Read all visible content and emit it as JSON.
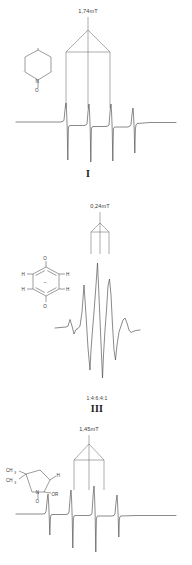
{
  "figure": {
    "type": "epr-spectra-figure",
    "panel_count": 3
  },
  "panels": [
    {
      "id": "panel-1",
      "roman_numeral": "I",
      "splitting_label": "1,74mT",
      "structure": {
        "name": "pyridine-N-oxide-ring",
        "atoms": [
          "N",
          "O"
        ],
        "ring": "six-membered"
      },
      "spectrum": {
        "name": "nitroxide-triplet",
        "line_count": 3,
        "pattern": "1:1:1"
      },
      "tree": {
        "name": "hyperfine-splitting-tree",
        "branches": 3
      }
    },
    {
      "id": "panel-2",
      "roman_numeral": "III",
      "splitting_label": "0,24mT",
      "ratio_label": "1:4:6:4:1",
      "structure": {
        "name": "benzosemiquinone-radical-anion",
        "atoms": [
          "O",
          "H",
          "H",
          "H",
          "H",
          "O"
        ],
        "charge": "–",
        "ring": "six-membered"
      },
      "spectrum": {
        "name": "quintet",
        "line_count": 5,
        "pattern": "1:4:6:4:1"
      },
      "tree": {
        "name": "hyperfine-splitting-tree",
        "branches": 3
      }
    },
    {
      "id": "panel-3",
      "roman_numeral": "",
      "splitting_label": "1,45mT",
      "structure": {
        "name": "pyrrolidine-nitroxide-spin-adduct",
        "atoms": [
          "CH",
          "CH",
          "H",
          "N",
          "O",
          "OR"
        ],
        "substituent_1": "CH₃",
        "substituent_2": "CH₃",
        "substituent_3": "H",
        "substituent_4": "OR",
        "ring": "five-membered"
      },
      "spectrum": {
        "name": "four-line-spectrum",
        "line_count": 4,
        "pattern": "1:1:1:1"
      },
      "tree": {
        "name": "hyperfine-splitting-tree",
        "branches": 3
      }
    }
  ],
  "colors": {
    "trace": "#4a4a4a",
    "text": "#3a3a3a",
    "background": "#ffffff"
  }
}
